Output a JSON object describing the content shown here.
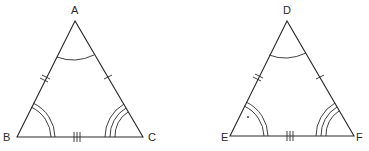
{
  "diagram": {
    "type": "congruent-triangles",
    "triangles": [
      {
        "name": "ABC",
        "vertices": {
          "top": "A",
          "left": "B",
          "right": "C"
        },
        "side_marks": {
          "AB": 2,
          "AC": 1,
          "BC": 3
        },
        "angle_marks": {
          "A": 1,
          "B": 2,
          "C": 3
        }
      },
      {
        "name": "DEF",
        "vertices": {
          "top": "D",
          "left": "E",
          "right": "F"
        },
        "side_marks": {
          "DE": 2,
          "DF": 1,
          "EF": 3
        },
        "angle_marks": {
          "D": 1,
          "E": 2,
          "F": 3
        }
      }
    ],
    "line_color": "#2a2a2a"
  }
}
